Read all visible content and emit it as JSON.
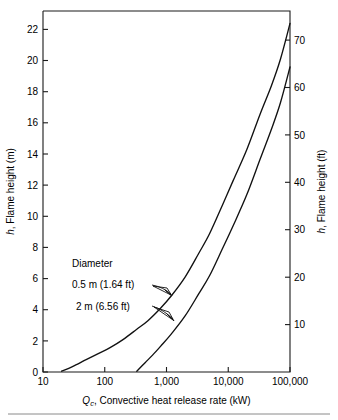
{
  "figure": {
    "background_color": "#ffffff",
    "line_color": "#111111",
    "axis_color": "#1a1a1a",
    "rule_color": "#8a8a8a"
  },
  "axes": {
    "x": {
      "label_prefix": "Q",
      "label_subscript": "c",
      "label_rest": ", Convective heat release rate (kW)",
      "scale": "log",
      "range": [
        10,
        100000
      ],
      "tick_labels": [
        "10",
        "100",
        "1,000",
        "10,000",
        "100,000"
      ],
      "tick_values": [
        10,
        100,
        1000,
        10000,
        100000
      ]
    },
    "y_left": {
      "label_prefix": "h",
      "label_rest": ", Flame height (m)",
      "range": [
        0,
        23.2
      ],
      "tick_labels": [
        "0",
        "2",
        "4",
        "6",
        "8",
        "10",
        "12",
        "14",
        "16",
        "18",
        "20",
        "22"
      ],
      "tick_values": [
        0,
        2,
        4,
        6,
        8,
        10,
        12,
        14,
        16,
        18,
        20,
        22
      ]
    },
    "y_right": {
      "label_prefix": "h",
      "label_rest": ", Flame height (ft)",
      "range": [
        0,
        76.1
      ],
      "tick_labels": [
        "10",
        "20",
        "30",
        "40",
        "50",
        "60",
        "70"
      ],
      "tick_values": [
        10,
        20,
        30,
        40,
        50,
        60,
        70
      ]
    }
  },
  "annotations": {
    "group_title": "Diameter",
    "series_1_label": "0.5 m (1.64 ft)",
    "series_2_label": "2 m (6.56 ft)"
  },
  "chart_data": {
    "type": "line",
    "title": "",
    "xlabel": "Qc, Convective heat release rate (kW)",
    "ylabel": "h, Flame height (m)",
    "ylabel_secondary": "h, Flame height (ft)",
    "xscale": "log",
    "xlim": [
      10,
      100000
    ],
    "ylim": [
      0,
      23.2
    ],
    "ylim_secondary": [
      0,
      76.1
    ],
    "grid": false,
    "legend": "annotated-inline",
    "series": [
      {
        "name": "0.5 m (1.64 ft)",
        "diameter_m": 0.5,
        "diameter_ft": 1.64,
        "x": [
          20,
          30,
          50,
          80,
          120,
          200,
          330,
          500,
          800,
          1200,
          2000,
          3300,
          5000,
          8000,
          12000,
          20000,
          33000,
          50000,
          70000,
          100000
        ],
        "y": [
          0.05,
          0.35,
          0.8,
          1.2,
          1.55,
          2.1,
          2.75,
          3.3,
          4.1,
          4.9,
          6.1,
          7.6,
          8.9,
          10.7,
          12.3,
          14.3,
          16.6,
          18.4,
          20.1,
          22.4
        ]
      },
      {
        "name": "2 m (6.56 ft)",
        "diameter_m": 2,
        "diameter_ft": 6.56,
        "x": [
          330,
          450,
          600,
          800,
          1200,
          2000,
          3300,
          5000,
          8000,
          12000,
          20000,
          33000,
          50000,
          70000,
          100000
        ],
        "y": [
          0.05,
          0.6,
          1.1,
          1.65,
          2.45,
          3.6,
          5.0,
          6.2,
          7.9,
          9.4,
          11.4,
          13.7,
          15.6,
          17.3,
          19.6
        ]
      }
    ]
  }
}
